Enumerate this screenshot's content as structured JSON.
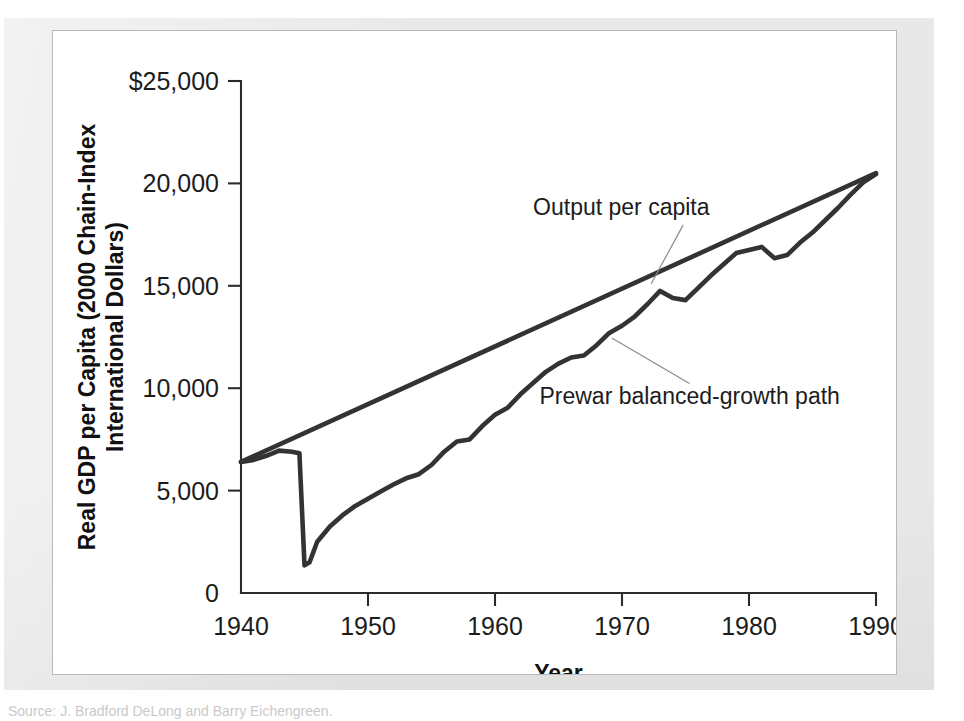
{
  "figure": {
    "panel_background": "#ffffff",
    "mat_background": "#e8e8e8",
    "line_color": "#333333",
    "axis_color": "#2b2b2b"
  },
  "source_note": "Source: J. Bradford DeLong and Barry Eichengreen.",
  "chart_data": {
    "type": "line",
    "title": "",
    "xlabel": "Year",
    "ylabel": "Real GDP per Capita (2000 Chain-Index International Dollars)",
    "xlim": [
      1940,
      1990
    ],
    "ylim": [
      0,
      25000
    ],
    "xticks": [
      1940,
      1950,
      1960,
      1970,
      1980,
      1990
    ],
    "xtick_labels": [
      "1940",
      "1950",
      "1960",
      "1970",
      "1980",
      "1990"
    ],
    "yticks": [
      0,
      5000,
      10000,
      15000,
      20000,
      25000
    ],
    "ytick_labels": [
      "0",
      "5,000",
      "10,000",
      "15,000",
      "20,000",
      "$25,000"
    ],
    "grid": false,
    "legend_position": "inline-annotations",
    "annotations": [
      {
        "label": "Output per capita",
        "text_x": 1963.0,
        "text_y": 18450,
        "target_x": 1972.3,
        "target_y": 15100
      },
      {
        "label": "Prewar balanced-growth path",
        "text_x": 1963.5,
        "text_y": 9250,
        "target_x": 1969.2,
        "target_y": 12450
      }
    ],
    "series": [
      {
        "name": "Output per capita",
        "x": [
          1940,
          1941,
          1942,
          1943,
          1944,
          1944.6,
          1945,
          1945.4,
          1946,
          1947,
          1948,
          1949,
          1950,
          1951,
          1952,
          1953,
          1954,
          1955,
          1956,
          1957,
          1958,
          1959,
          1960,
          1961,
          1962,
          1963,
          1964,
          1965,
          1966,
          1967,
          1968,
          1969,
          1970,
          1971,
          1972,
          1973,
          1974,
          1975,
          1976,
          1977,
          1978,
          1979,
          1980,
          1981,
          1982,
          1983,
          1984,
          1985,
          1986,
          1987,
          1988,
          1989,
          1990
        ],
        "y": [
          6400,
          6500,
          6700,
          6950,
          6900,
          6820,
          1350,
          1500,
          2500,
          3250,
          3800,
          4250,
          4600,
          4950,
          5300,
          5600,
          5800,
          6250,
          6900,
          7400,
          7500,
          8150,
          8700,
          9050,
          9700,
          10250,
          10800,
          11200,
          11500,
          11600,
          12100,
          12700,
          13050,
          13500,
          14100,
          14750,
          14400,
          14300,
          14900,
          15500,
          16050,
          16600,
          16750,
          16900,
          16350,
          16500,
          17100,
          17600,
          18200,
          18800,
          19450,
          20050,
          20450
        ]
      },
      {
        "name": "Prewar balanced-growth path",
        "x": [
          1940,
          1990
        ],
        "y": [
          6400,
          20500
        ]
      }
    ]
  }
}
